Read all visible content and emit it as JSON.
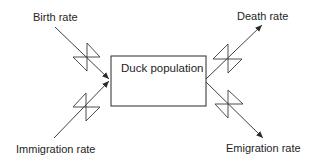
{
  "diagram": {
    "type": "stock-and-flow",
    "stock": {
      "label": "Duck population"
    },
    "inflows": [
      {
        "label": "Birth rate"
      },
      {
        "label": "Immigration rate"
      }
    ],
    "outflows": [
      {
        "label": "Death rate"
      },
      {
        "label": "Emigration rate"
      }
    ],
    "colors": {
      "line": "#2b2b2b",
      "text": "#1e1e1e",
      "background": "#ffffff"
    }
  }
}
